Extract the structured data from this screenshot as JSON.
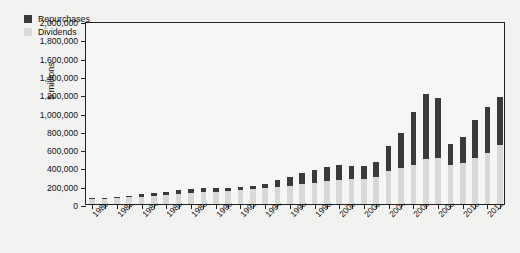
{
  "chart_data": {
    "type": "bar",
    "stacked": true,
    "title": "",
    "xlabel": "",
    "ylabel": "$ millions",
    "ylim": [
      0,
      2000000
    ],
    "ytick_labels": [
      "0",
      "200,000",
      "400,000",
      "600,000",
      "800,000",
      "1,000,000",
      "1,200,000",
      "1,400,000",
      "1,600,000",
      "1,800,000",
      "2,000,000"
    ],
    "ytick_values": [
      0,
      200000,
      400000,
      600000,
      800000,
      1000000,
      1200000,
      1400000,
      1600000,
      1800000,
      2000000
    ],
    "grid": false,
    "legend_position": "top-left",
    "categories": [
      1980,
      1981,
      1982,
      1983,
      1984,
      1985,
      1986,
      1987,
      1988,
      1989,
      1990,
      1991,
      1992,
      1993,
      1994,
      1995,
      1996,
      1997,
      1998,
      1999,
      2000,
      2001,
      2002,
      2003,
      2004,
      2005,
      2006,
      2007,
      2008,
      2009,
      2010,
      2011,
      2012,
      2013
    ],
    "xtick_labels": [
      "1980",
      "1982",
      "1984",
      "1986",
      "1988",
      "1990",
      "1992",
      "1994",
      "1996",
      "1998",
      "2000",
      "2002",
      "2004",
      "2006",
      "2008",
      "2010",
      "2012"
    ],
    "series": [
      {
        "name": "Dividends",
        "color": "#d8d8d6",
        "values": [
          55000,
          58000,
          66000,
          72000,
          82000,
          88000,
          96000,
          108000,
          120000,
          128000,
          134000,
          138000,
          150000,
          160000,
          170000,
          185000,
          200000,
          215000,
          232000,
          250000,
          262000,
          268000,
          272000,
          290000,
          360000,
          390000,
          430000,
          490000,
          500000,
          430000,
          450000,
          500000,
          560000,
          640000
        ]
      },
      {
        "name": "Repurchases",
        "color": "#3a3a3a",
        "values": [
          8000,
          10000,
          12000,
          14000,
          24000,
          28000,
          30000,
          40000,
          42000,
          42000,
          40000,
          36000,
          34000,
          40000,
          50000,
          75000,
          100000,
          120000,
          140000,
          150000,
          160000,
          152000,
          145000,
          170000,
          270000,
          390000,
          580000,
          710000,
          660000,
          230000,
          280000,
          420000,
          500000,
          530000
        ]
      }
    ],
    "totals": [
      63000,
      68000,
      78000,
      86000,
      106000,
      116000,
      126000,
      148000,
      162000,
      170000,
      174000,
      174000,
      184000,
      200000,
      220000,
      260000,
      300000,
      335000,
      372000,
      400000,
      422000,
      420000,
      417000,
      460000,
      630000,
      780000,
      1010000,
      1200000,
      1160000,
      660000,
      730000,
      920000,
      1060000,
      1170000
    ]
  },
  "legend": {
    "items": [
      {
        "label": "Repurchases",
        "color": "#3a3a3a"
      },
      {
        "label": "Dividends",
        "color": "#d8d8d6"
      }
    ]
  }
}
